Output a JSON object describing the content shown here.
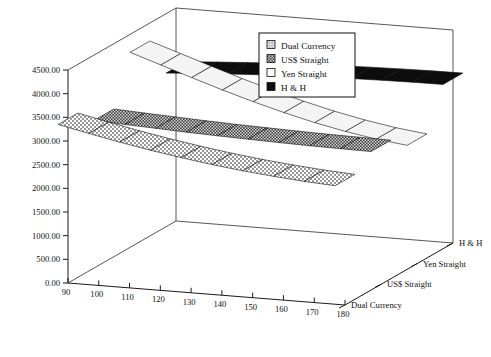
{
  "chart_data": {
    "type": "line",
    "title": "",
    "xlabel": "",
    "ylabel": "",
    "zlabel": "",
    "projection": "3d-ribbon",
    "grid": false,
    "legend_position": "top-right",
    "x": [
      90,
      100,
      110,
      120,
      130,
      140,
      150,
      160,
      170,
      180
    ],
    "xlim": [
      90,
      180
    ],
    "ylim": [
      0,
      4500
    ],
    "ytick_labels": [
      "0.00",
      "500.00",
      "1000.00",
      "1500.00",
      "2000.00",
      "2500.00",
      "3000.00",
      "3500.00",
      "4000.00",
      "4500.00"
    ],
    "ytick_values": [
      0,
      500,
      1000,
      1500,
      2000,
      2500,
      3000,
      3500,
      4000,
      4500
    ],
    "xtick_labels": [
      "90",
      "100",
      "110",
      "120",
      "130",
      "140",
      "150",
      "160",
      "170",
      "180"
    ],
    "z_categories": [
      "Dual Currency",
      "US$ Straight",
      "Yen Straight",
      "H & H"
    ],
    "series": [
      {
        "name": "Dual Currency",
        "fill": "light-checker",
        "values": [
          3470,
          3330,
          3200,
          3080,
          2975,
          2880,
          2800,
          2735,
          2680,
          2640
        ]
      },
      {
        "name": "US$ Straight",
        "fill": "dark-checker",
        "values": [
          3120,
          3085,
          3055,
          3025,
          3000,
          2980,
          2960,
          2945,
          2935,
          2925
        ]
      },
      {
        "name": "Yen Straight",
        "fill": "white",
        "values": [
          4120,
          3905,
          3690,
          3480,
          3285,
          3105,
          2945,
          2810,
          2700,
          2620
        ]
      },
      {
        "name": "H & H",
        "fill": "solid-black",
        "values": [
          3245,
          3290,
          3330,
          3365,
          3395,
          3420,
          3440,
          3455,
          3465,
          3470
        ]
      }
    ],
    "legend": [
      {
        "label": "Dual Currency",
        "swatch": "light-checker"
      },
      {
        "label": "US$ Straight",
        "swatch": "dark-checker"
      },
      {
        "label": "Yen Straight",
        "swatch": "white"
      },
      {
        "label": "H & H",
        "swatch": "solid-black"
      }
    ],
    "colors": {
      "axis": "#1a1a1a",
      "box": "#444444",
      "light_checker": "#c9c9c9",
      "dark_checker": "#6e6e6e",
      "white_fill": "#f2f2f2",
      "black_fill": "#0d0d0d",
      "background": "#ffffff"
    }
  }
}
